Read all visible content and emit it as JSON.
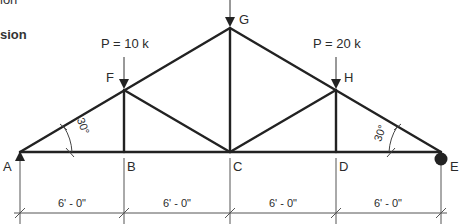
{
  "header": {
    "line1": "ion",
    "line2": "sion"
  },
  "loads": [
    {
      "label": "P = 10 k",
      "node": "F"
    },
    {
      "label": "",
      "node": "G"
    },
    {
      "label": "P = 20 k",
      "node": "H"
    }
  ],
  "nodes": {
    "A": "A",
    "B": "B",
    "C": "C",
    "D": "D",
    "E": "E",
    "F": "F",
    "G": "G",
    "H": "H"
  },
  "angles": {
    "left": "30°",
    "right": "30°"
  },
  "dimensions": [
    "6' - 0\"",
    "6' - 0\"",
    "6' - 0\"",
    "6' - 0\""
  ],
  "colors": {
    "member": "#222222",
    "dim": "#555555"
  }
}
